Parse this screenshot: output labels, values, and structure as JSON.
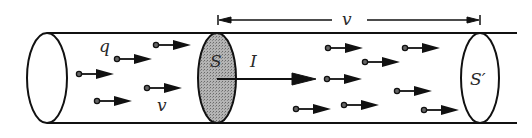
{
  "diagram": {
    "labels": {
      "charge": "q",
      "velocity_inside": "v",
      "cross_section_start": "S",
      "current": "I",
      "cross_section_end": "S′",
      "dimension": "v"
    },
    "colors": {
      "stroke": "#111111",
      "shaded_section": "#a8a8a8",
      "background": "#ffffff"
    },
    "tube": {
      "top_y": 33,
      "bottom_y": 123,
      "left_x": 47,
      "right_x": 517
    },
    "sections": [
      {
        "name": "left-end",
        "cx": 47,
        "cy": 78,
        "rx": 20,
        "ry": 45,
        "shaded": false
      },
      {
        "name": "S",
        "cx": 217,
        "cy": 78,
        "rx": 19,
        "ry": 45,
        "shaded": true
      },
      {
        "name": "S-prime",
        "cx": 480,
        "cy": 78,
        "rx": 19,
        "ry": 45,
        "shaded": false
      }
    ],
    "particles": [
      {
        "x": 156,
        "y": 45
      },
      {
        "x": 117,
        "y": 59
      },
      {
        "x": 79,
        "y": 74
      },
      {
        "x": 147,
        "y": 88
      },
      {
        "x": 97,
        "y": 101
      },
      {
        "x": 328,
        "y": 48
      },
      {
        "x": 405,
        "y": 48
      },
      {
        "x": 365,
        "y": 62
      },
      {
        "x": 327,
        "y": 79
      },
      {
        "x": 397,
        "y": 91
      },
      {
        "x": 296,
        "y": 109
      },
      {
        "x": 344,
        "y": 105
      },
      {
        "x": 424,
        "y": 110
      }
    ],
    "current_arrow": {
      "x1": 217,
      "y": 79,
      "x2": 316
    },
    "dimension_arrow": {
      "y": 20,
      "x1": 218,
      "x2": 480
    }
  }
}
